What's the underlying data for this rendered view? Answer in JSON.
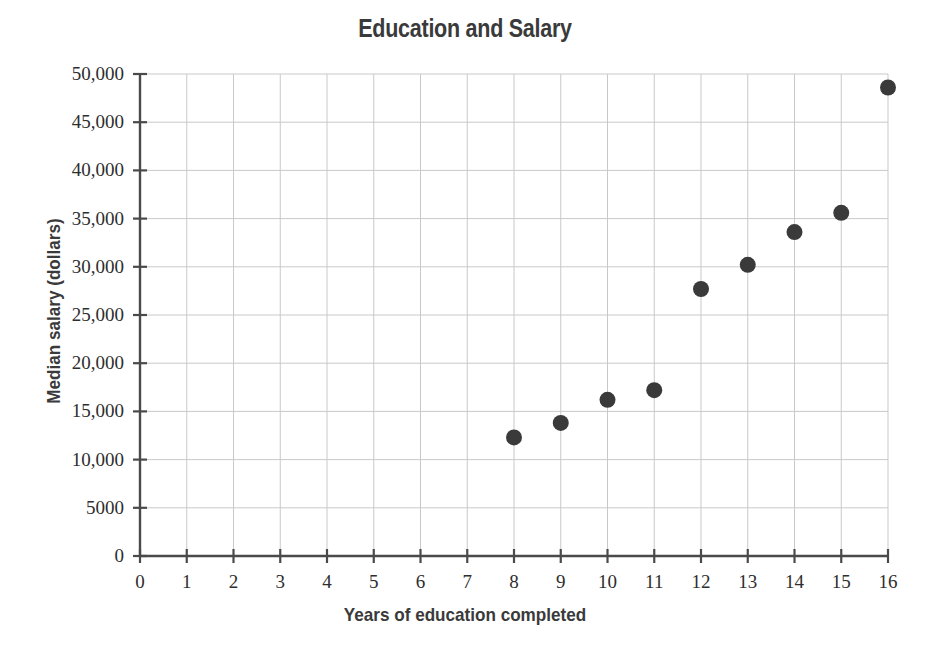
{
  "chart_data": {
    "type": "scatter",
    "title": "Education and Salary",
    "xlabel": "Years of education completed",
    "ylabel": "Median salary (dollars)",
    "xlim": [
      0,
      16
    ],
    "ylim": [
      0,
      50000
    ],
    "grid": true,
    "legend": "none",
    "marker": {
      "shape": "circle",
      "color": "#3a3a3a",
      "size_px": 16
    },
    "x_ticks": [
      0,
      1,
      2,
      3,
      4,
      5,
      6,
      7,
      8,
      9,
      10,
      11,
      12,
      13,
      14,
      15,
      16
    ],
    "x_tick_labels": [
      "0",
      "1",
      "2",
      "3",
      "4",
      "5",
      "6",
      "7",
      "8",
      "9",
      "10",
      "11",
      "12",
      "13",
      "14",
      "15",
      "16"
    ],
    "y_ticks": [
      0,
      5000,
      10000,
      15000,
      20000,
      25000,
      30000,
      35000,
      40000,
      45000,
      50000
    ],
    "y_tick_labels": [
      "0",
      "5000",
      "10,000",
      "15,000",
      "20,000",
      "25,000",
      "30,000",
      "35,000",
      "40,000",
      "45,000",
      "50,000"
    ],
    "points": [
      {
        "x": 8,
        "y": 12300
      },
      {
        "x": 9,
        "y": 13800
      },
      {
        "x": 10,
        "y": 16200
      },
      {
        "x": 11,
        "y": 17200
      },
      {
        "x": 12,
        "y": 27700
      },
      {
        "x": 13,
        "y": 30200
      },
      {
        "x": 14,
        "y": 33600
      },
      {
        "x": 15,
        "y": 35600
      },
      {
        "x": 16,
        "y": 48600
      }
    ],
    "series": [
      {
        "name": "Median salary",
        "x": [
          8,
          9,
          10,
          11,
          12,
          13,
          14,
          15,
          16
        ],
        "values": [
          12300,
          13800,
          16200,
          17200,
          27700,
          30200,
          33600,
          35600,
          48600
        ]
      }
    ]
  },
  "colors": {
    "marker": "#3a3a3a",
    "axis": "#4a4a4a",
    "grid": "#c9c9c9",
    "text": "#3a3a3a",
    "background": "#ffffff"
  }
}
